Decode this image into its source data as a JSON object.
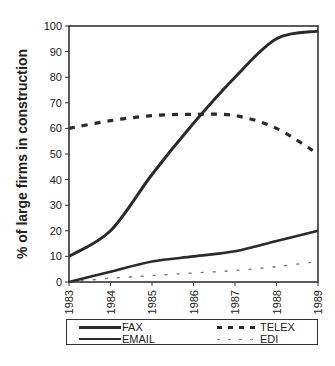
{
  "chart_data": {
    "type": "line",
    "title": "",
    "xlabel": "",
    "ylabel": "% of large firms in construction",
    "x": [
      "1983",
      "1984",
      "1985",
      "1986",
      "1987",
      "1988",
      "1989"
    ],
    "ylim": [
      0,
      100
    ],
    "yticks": [
      0,
      10,
      20,
      30,
      40,
      50,
      60,
      70,
      80,
      90,
      100
    ],
    "grid": false,
    "legend_position": "bottom",
    "series": [
      {
        "name": "FAX",
        "style": "solid-thick",
        "color": "#2a2a2a",
        "values": [
          10,
          20,
          42,
          62,
          80,
          95,
          98
        ]
      },
      {
        "name": "TELEX",
        "style": "dashed-thick",
        "color": "#2a2a2a",
        "values": [
          60,
          63,
          65,
          65.5,
          65,
          60,
          50
        ]
      },
      {
        "name": "EMAIL",
        "style": "solid",
        "color": "#2a2a2a",
        "values": [
          0,
          4,
          8,
          10,
          12,
          16,
          20
        ]
      },
      {
        "name": "EDI",
        "style": "dashed-thin",
        "color": "#777777",
        "values": [
          0,
          1.5,
          2.5,
          3.5,
          4.5,
          6,
          8
        ]
      }
    ]
  },
  "legend": {
    "items": [
      {
        "label": "FAX"
      },
      {
        "label": "TELEX"
      },
      {
        "label": "EMAIL"
      },
      {
        "label": "EDI"
      }
    ]
  }
}
